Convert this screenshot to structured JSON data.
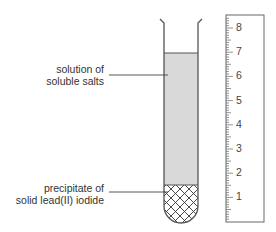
{
  "labels": {
    "solution": [
      "solution of",
      "soluble salts"
    ],
    "precipitate": [
      "precipitate of",
      "solid lead(II) iodide"
    ]
  },
  "ruler": {
    "marks": [
      "8",
      "7",
      "6",
      "5",
      "4",
      "3",
      "2",
      "1"
    ]
  },
  "colors": {
    "solution_fill": "#d9d9d9",
    "outline": "#555555",
    "background": "#ffffff"
  }
}
